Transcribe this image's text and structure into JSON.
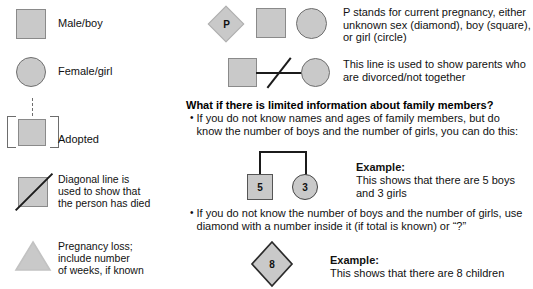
{
  "legend": {
    "items": [
      {
        "key": "male",
        "label": "Male/boy",
        "symbol": "square"
      },
      {
        "key": "female",
        "label": "Female/girl",
        "symbol": "circle"
      },
      {
        "key": "adopted",
        "label": "Adopted",
        "symbol": "square-in-brackets-with-dashed-line"
      },
      {
        "key": "deceased",
        "label": "Diagonal line is\nused to show that\nthe person has died",
        "symbol": "square-with-diagonal-slash"
      },
      {
        "key": "pregnancy_loss",
        "label": "Pregnancy loss;\ninclude number\nof weeks, if known",
        "symbol": "triangle"
      }
    ]
  },
  "right": {
    "pregnancy": {
      "diamond_letter": "P",
      "text": "P stands for current pregnancy, either\nunknown sex (diamond), boy (square),\nor girl (circle)"
    },
    "divorce": {
      "text": "This line is used to show parents who are\ndivorced/not together"
    },
    "limited_info": {
      "heading": "What if there is limited information about family members?",
      "bullet_marker": "•",
      "bullet1": "If you do not know names and ages of family members, but do\nknow the number of boys and the number of girls, you can do this:",
      "sibship_example": {
        "square_value": "5",
        "circle_value": "3",
        "example_label": "Example:",
        "example_text": "This shows that there are 5 boys and 3 girls"
      },
      "bullet2": "If you do not know the number of boys and the number of girls, use\ndiamond with a number inside it (if total is known) or “?”",
      "diamond_example": {
        "diamond_value": "8",
        "example_label": "Example:",
        "example_text": "This shows that there are 8 children"
      }
    }
  },
  "colors": {
    "shape_fill": "#c9c9c9",
    "shape_stroke": "#8a8a8a",
    "line": "#1b1b1b",
    "text": "#111111",
    "background": "#ffffff"
  }
}
